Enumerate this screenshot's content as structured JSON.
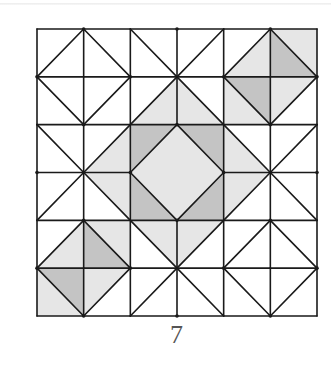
{
  "figure": {
    "caption": "7",
    "grid": {
      "rows": 6,
      "cols": 6,
      "x0": 37,
      "y0": 29,
      "x1": 317,
      "y1": 316
    },
    "colors": {
      "white": "#ffffff",
      "light": "#e6e6e6",
      "dark": "#c4c4c4",
      "line": "#1a1a1a"
    },
    "center_block": {
      "row": 2,
      "col": 2,
      "span": 2,
      "corner_fill": "dark",
      "diamond_fill": "light"
    },
    "cells": [
      [
        {
          "diag": "/",
          "a": "white",
          "b": "white"
        },
        {
          "diag": "\\",
          "a": "white",
          "b": "white"
        },
        {
          "diag": "\\",
          "a": "white",
          "b": "white"
        },
        {
          "diag": "/",
          "a": "white",
          "b": "white"
        },
        {
          "diag": "/",
          "a": "white",
          "b": "light"
        },
        {
          "diag": "\\",
          "a": "light",
          "b": "dark"
        }
      ],
      [
        {
          "diag": "\\",
          "a": "white",
          "b": "white"
        },
        {
          "diag": "/",
          "a": "white",
          "b": "white"
        },
        {
          "diag": "/",
          "a": "white",
          "b": "light"
        },
        {
          "diag": "\\",
          "a": "white",
          "b": "light"
        },
        {
          "diag": "\\",
          "a": "dark",
          "b": "light"
        },
        {
          "diag": "/",
          "a": "light",
          "b": "white"
        }
      ],
      [
        {
          "diag": "\\",
          "a": "white",
          "b": "white"
        },
        {
          "diag": "/",
          "a": "white",
          "b": "light"
        },
        null,
        null,
        {
          "diag": "\\",
          "a": "white",
          "b": "light"
        },
        {
          "diag": "/",
          "a": "white",
          "b": "white"
        }
      ],
      [
        {
          "diag": "/",
          "a": "white",
          "b": "white"
        },
        {
          "diag": "\\",
          "a": "light",
          "b": "white"
        },
        null,
        null,
        {
          "diag": "/",
          "a": "light",
          "b": "white"
        },
        {
          "diag": "\\",
          "a": "white",
          "b": "white"
        }
      ],
      [
        {
          "diag": "/",
          "a": "white",
          "b": "light"
        },
        {
          "diag": "\\",
          "a": "light",
          "b": "dark"
        },
        {
          "diag": "\\",
          "a": "light",
          "b": "white"
        },
        {
          "diag": "/",
          "a": "light",
          "b": "white"
        },
        {
          "diag": "/",
          "a": "white",
          "b": "white"
        },
        {
          "diag": "\\",
          "a": "white",
          "b": "white"
        }
      ],
      [
        {
          "diag": "\\",
          "a": "dark",
          "b": "light"
        },
        {
          "diag": "/",
          "a": "light",
          "b": "white"
        },
        {
          "diag": "/",
          "a": "white",
          "b": "white"
        },
        {
          "diag": "\\",
          "a": "white",
          "b": "white"
        },
        {
          "diag": "\\",
          "a": "white",
          "b": "white"
        },
        {
          "diag": "/",
          "a": "white",
          "b": "white"
        }
      ]
    ]
  }
}
